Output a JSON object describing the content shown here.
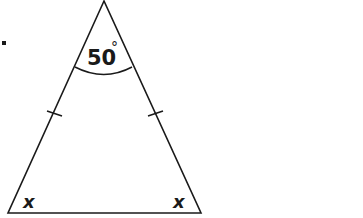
{
  "diagram": {
    "type": "isosceles-triangle",
    "bullet": "•",
    "apex_angle": {
      "value": "50",
      "unit": "°",
      "label": "50°"
    },
    "base_angles": [
      {
        "position": "bottom-left",
        "label": "x"
      },
      {
        "position": "bottom-right",
        "label": "x"
      }
    ],
    "equal_sides_marked": [
      "left-side",
      "right-side"
    ],
    "colors": {
      "stroke": "#1a1a1a",
      "background": "#ffffff"
    }
  }
}
